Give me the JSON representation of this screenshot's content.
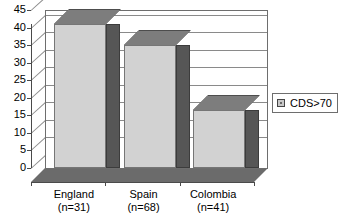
{
  "chart_data": {
    "type": "bar",
    "title": "",
    "subtitle": "",
    "xlabel": "",
    "ylabel": "",
    "categories": [
      "England",
      "Spain",
      "Colombia"
    ],
    "category_sublabels": [
      "(n=31)",
      "(n=68)",
      "(n=41)"
    ],
    "series": [
      {
        "name": "CDS>70",
        "values": [
          41,
          35,
          16.5
        ]
      }
    ],
    "ylim": [
      0,
      45
    ],
    "ytick_labels": [
      "0",
      "5",
      "10",
      "15",
      "20",
      "25",
      "30",
      "35",
      "40",
      "45"
    ],
    "ytick_values": [
      0,
      5,
      10,
      15,
      20,
      25,
      30,
      35,
      40,
      45
    ],
    "grid": true,
    "legend_position": "right",
    "style": "3d-column",
    "colors": {
      "bar_front": "#d2d2d2",
      "bar_side": "#565656",
      "bar_top": "#7d7d7d",
      "floor": "#6b6b6b",
      "gridline": "#8a8a8a",
      "axis": "#4a4a4a",
      "background": "#ffffff"
    }
  },
  "legend": {
    "entries": [
      {
        "label": "CDS>70",
        "swatch": "#c8c8c8"
      }
    ]
  }
}
